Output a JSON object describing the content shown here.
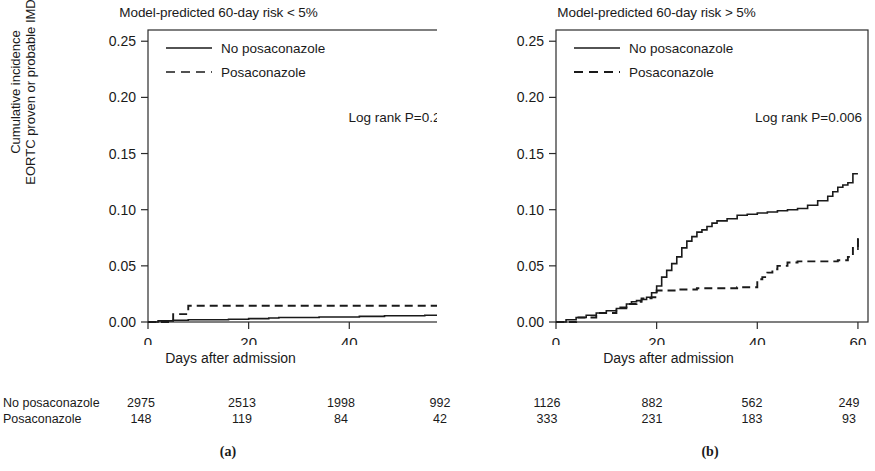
{
  "figure": {
    "xlabel": "Days after admission",
    "ylabel_line1": "Cumulative incidence",
    "ylabel_line2": "EORTC proven or probable IMD",
    "y_ticks": [
      "0.00",
      "0.05",
      "0.10",
      "0.15",
      "0.20",
      "0.25"
    ],
    "x_ticks": [
      "0",
      "20",
      "40",
      "60"
    ],
    "legend": {
      "solid_label": "No posaconazole",
      "dashed_label": "Posaconazole"
    },
    "subcaption_a": "(a)",
    "subcaption_b": "(b)"
  },
  "panels": [
    {
      "id": "a",
      "title": "Model-predicted 60-day risk < 5%",
      "annotation": "Log rank P=0.21"
    },
    {
      "id": "b",
      "title": "Model-predicted 60-day risk > 5%",
      "annotation": "Log rank P=0.006"
    }
  ],
  "risk_table": {
    "row_labels": [
      "No posaconazole",
      "Posaconazole"
    ],
    "times": [
      "0",
      "20",
      "40",
      "60"
    ],
    "panel_a": {
      "no_posaconazole": [
        "2975",
        "2513",
        "1998",
        "992"
      ],
      "posaconazole": [
        "148",
        "119",
        "84",
        "42"
      ]
    },
    "panel_b": {
      "no_posaconazole": [
        "1126",
        "882",
        "562",
        "249"
      ],
      "posaconazole": [
        "333",
        "231",
        "183",
        "93"
      ]
    }
  },
  "chart_data": {
    "type": "line",
    "xlabel": "Days after admission",
    "ylabel": "Cumulative incidence EORTC proven or probable IMD",
    "xlim": [
      0,
      62
    ],
    "ylim": [
      0.0,
      0.26
    ],
    "x_ticks": [
      0,
      20,
      40,
      60
    ],
    "y_ticks": [
      0.0,
      0.05,
      0.1,
      0.15,
      0.2,
      0.25
    ],
    "grid": false,
    "legend_position": "top-left",
    "panels": [
      {
        "name": "(a) Model-predicted 60-day risk < 5%",
        "annotation": "Log rank P=0.21",
        "series": [
          {
            "name": "No posaconazole",
            "style": "solid",
            "x": [
              0,
              2,
              5,
              8,
              12,
              16,
              20,
              24,
              26,
              30,
              34,
              38,
              42,
              47,
              52,
              55,
              58,
              60
            ],
            "y": [
              0.0,
              0.001,
              0.0015,
              0.002,
              0.002,
              0.0025,
              0.003,
              0.0035,
              0.004,
              0.004,
              0.0045,
              0.0045,
              0.005,
              0.0055,
              0.0055,
              0.006,
              0.0065,
              0.0065
            ]
          },
          {
            "name": "Posaconazole",
            "style": "dashed",
            "x": [
              0,
              3,
              5,
              7,
              8,
              20,
              40,
              60
            ],
            "y": [
              0.0,
              0.0,
              0.007,
              0.007,
              0.0145,
              0.0145,
              0.0145,
              0.0145
            ]
          }
        ]
      },
      {
        "name": "(b) Model-predicted 60-day risk > 5%",
        "annotation": "Log rank P=0.006",
        "series": [
          {
            "name": "No posaconazole",
            "style": "solid",
            "x": [
              0,
              2,
              4,
              6,
              8,
              10,
              12,
              14,
              15,
              16,
              17,
              18,
              19,
              20,
              21,
              22,
              23,
              24,
              25,
              26,
              27,
              28,
              29,
              30,
              31,
              32,
              34,
              36,
              38,
              40,
              42,
              44,
              46,
              48,
              50,
              52,
              54,
              55,
              56,
              57,
              58,
              59,
              60
            ],
            "y": [
              0.0,
              0.002,
              0.004,
              0.006,
              0.008,
              0.01,
              0.012,
              0.016,
              0.018,
              0.019,
              0.02,
              0.022,
              0.026,
              0.032,
              0.04,
              0.046,
              0.052,
              0.058,
              0.066,
              0.072,
              0.076,
              0.08,
              0.082,
              0.085,
              0.088,
              0.09,
              0.092,
              0.095,
              0.096,
              0.097,
              0.098,
              0.099,
              0.1,
              0.101,
              0.104,
              0.108,
              0.112,
              0.116,
              0.12,
              0.122,
              0.124,
              0.132,
              0.132
            ]
          },
          {
            "name": "Posaconazole",
            "style": "dashed",
            "x": [
              0,
              4,
              8,
              12,
              14,
              16,
              17,
              19,
              20,
              24,
              28,
              32,
              36,
              39,
              40,
              41,
              42,
              43,
              44,
              46,
              48,
              52,
              56,
              58,
              59,
              60
            ],
            "y": [
              0.0,
              0.004,
              0.008,
              0.013,
              0.016,
              0.018,
              0.021,
              0.022,
              0.028,
              0.029,
              0.03,
              0.03,
              0.031,
              0.031,
              0.038,
              0.04,
              0.044,
              0.047,
              0.05,
              0.053,
              0.054,
              0.054,
              0.055,
              0.058,
              0.066,
              0.074
            ]
          }
        ]
      }
    ]
  }
}
